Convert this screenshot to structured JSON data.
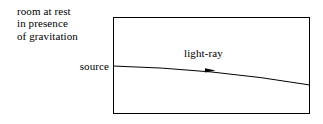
{
  "figure": {
    "caption_lines": [
      "room at rest",
      "in presence",
      "of gravitation"
    ],
    "source_label": "source",
    "ray_label": "light-ray",
    "colors": {
      "ink": "#000000",
      "background": "#ffffff"
    },
    "geometry": {
      "box": {
        "x": 113,
        "y": 17,
        "width": 197,
        "height": 97
      },
      "ray_start": {
        "x": 113,
        "y": 66
      },
      "ray_end": {
        "x": 310,
        "y": 85
      },
      "ray_control": {
        "x": 212,
        "y": 69
      },
      "arrow_at": {
        "x": 212,
        "y": 70
      }
    }
  }
}
